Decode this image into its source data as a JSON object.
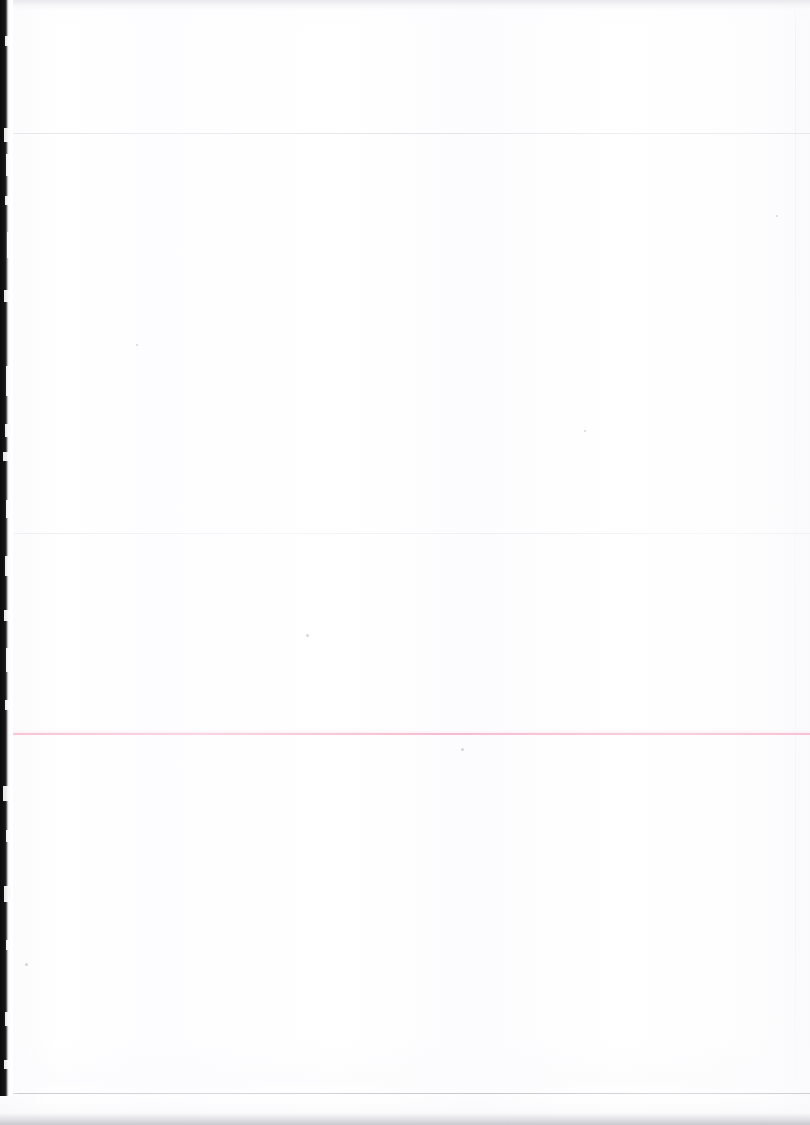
{
  "document": {
    "kind": "scanned-page",
    "title": "",
    "visible_text": "",
    "page_number": "",
    "body_text": ""
  },
  "canvas": {
    "width": 810,
    "height": 1125,
    "paper_color": "#fefeff",
    "background_color": "#ffffff"
  },
  "artifacts": {
    "binding_shadow": {
      "name": "left-scan-shadow",
      "color": "#0b0b0c",
      "x": 0,
      "y": 0,
      "width": 13,
      "height": 1096
    },
    "top_band": {
      "color": "#e8e8ed",
      "y": 0,
      "height": 9
    },
    "bottom_band": {
      "color": "#babac3",
      "y": 1117,
      "height": 8
    },
    "right_vertical_rule": {
      "color": "#f0f0f5",
      "x": 795
    }
  },
  "rules": [
    {
      "name": "rule-1",
      "y": 133,
      "color": "#e2e2e7",
      "style": "grey",
      "thickness": 1
    },
    {
      "name": "rule-2",
      "y": 533,
      "color": "#eeeef2",
      "style": "grey-soft",
      "thickness": 1
    },
    {
      "name": "rule-3-accent",
      "y": 733,
      "color": "#f6c0d3",
      "style": "pink",
      "thickness": 2
    },
    {
      "name": "rule-4",
      "y": 1093,
      "color": "#c6c6ce",
      "style": "grey-strong",
      "thickness": 1
    }
  ],
  "specks": [
    {
      "x": 306,
      "y": 634,
      "size": 3
    },
    {
      "x": 461,
      "y": 748,
      "size": 3
    },
    {
      "x": 584,
      "y": 430,
      "size": 2
    },
    {
      "x": 776,
      "y": 215,
      "size": 2
    },
    {
      "x": 25,
      "y": 963,
      "size": 3
    },
    {
      "x": 136,
      "y": 344,
      "size": 2
    }
  ],
  "wisps": [
    {
      "x": 5,
      "y": 36,
      "w": 4,
      "h": 10
    },
    {
      "x": 4,
      "y": 128,
      "w": 6,
      "h": 14
    },
    {
      "x": 6,
      "y": 154,
      "w": 4,
      "h": 22
    },
    {
      "x": 5,
      "y": 196,
      "w": 5,
      "h": 9
    },
    {
      "x": 7,
      "y": 232,
      "w": 3,
      "h": 26
    },
    {
      "x": 4,
      "y": 290,
      "w": 5,
      "h": 12
    },
    {
      "x": 6,
      "y": 366,
      "w": 4,
      "h": 30
    },
    {
      "x": 5,
      "y": 424,
      "w": 6,
      "h": 13
    },
    {
      "x": 3,
      "y": 452,
      "w": 7,
      "h": 9
    },
    {
      "x": 6,
      "y": 500,
      "w": 4,
      "h": 18
    },
    {
      "x": 5,
      "y": 556,
      "w": 5,
      "h": 20
    },
    {
      "x": 4,
      "y": 610,
      "w": 6,
      "h": 11
    },
    {
      "x": 6,
      "y": 648,
      "w": 4,
      "h": 24
    },
    {
      "x": 5,
      "y": 700,
      "w": 5,
      "h": 10
    },
    {
      "x": 3,
      "y": 786,
      "w": 6,
      "h": 15
    },
    {
      "x": 6,
      "y": 830,
      "w": 4,
      "h": 12
    },
    {
      "x": 4,
      "y": 886,
      "w": 7,
      "h": 16
    },
    {
      "x": 6,
      "y": 940,
      "w": 4,
      "h": 10
    },
    {
      "x": 5,
      "y": 1012,
      "w": 5,
      "h": 14
    },
    {
      "x": 4,
      "y": 1060,
      "w": 6,
      "h": 9
    }
  ]
}
